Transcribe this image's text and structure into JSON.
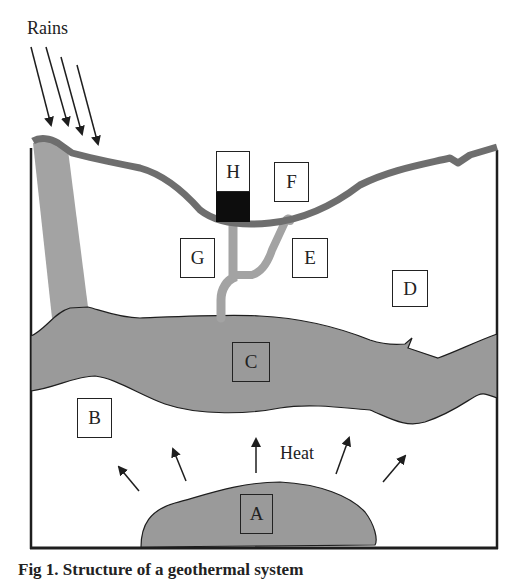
{
  "figure": {
    "annotations": {
      "rains": "Rains",
      "heat": "Heat"
    },
    "boxes": [
      {
        "id": "A",
        "label": "A"
      },
      {
        "id": "B",
        "label": "B"
      },
      {
        "id": "C",
        "label": "C"
      },
      {
        "id": "D",
        "label": "D"
      },
      {
        "id": "E",
        "label": "E"
      },
      {
        "id": "F",
        "label": "F"
      },
      {
        "id": "G",
        "label": "G"
      },
      {
        "id": "H",
        "label": "H"
      }
    ],
    "caption": "Fig 1. Structure of a geothermal system",
    "colors": {
      "surface_line": "#6e6e6e",
      "reservoir_fill": "#9a9a9a",
      "channel": "#a3a3a3",
      "outline": "#1e1e1e",
      "black_block": "#0d0d0d",
      "background": "#ffffff"
    }
  }
}
